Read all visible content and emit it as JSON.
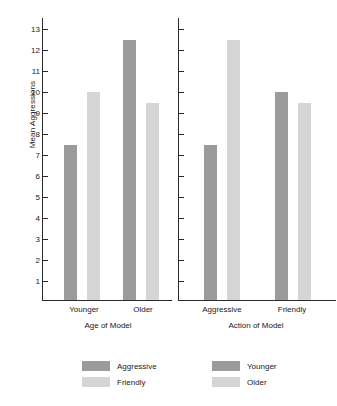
{
  "chart_data": {
    "type": "bar",
    "title": "",
    "ylabel": "Mean Aggressions",
    "ylim": [
      0,
      13.6
    ],
    "yticks": [
      1,
      2,
      3,
      4,
      5,
      6,
      7,
      8,
      9,
      10,
      11,
      12,
      13
    ],
    "grid": false,
    "legend_position": "bottom",
    "colors": {
      "dark": "#9b9b9b",
      "light": "#d5d5d5",
      "axis": "#2a2a2a",
      "text": "#1a1a1a",
      "background": "#ffffff"
    },
    "panels": [
      {
        "id": "age-of-model",
        "xlabel": "Age of Model",
        "categories": [
          "Younger",
          "Older"
        ],
        "series": [
          {
            "name": "Aggressive",
            "color": "#9b9b9b",
            "values": [
              7.5,
              12.5
            ]
          },
          {
            "name": "Friendly",
            "color": "#d5d5d5",
            "values": [
              10.0,
              9.5
            ]
          }
        ]
      },
      {
        "id": "action-of-model",
        "xlabel": "Action of Model",
        "categories": [
          "Aggressive",
          "Friendly"
        ],
        "series": [
          {
            "name": "Younger",
            "color": "#9b9b9b",
            "values": [
              7.5,
              10.0
            ]
          },
          {
            "name": "Older",
            "color": "#d5d5d5",
            "values": [
              12.5,
              9.5
            ]
          }
        ]
      }
    ]
  },
  "axis": {
    "ylabel": "Mean Aggressions",
    "tick_1": "1",
    "tick_2": "2",
    "tick_3": "3",
    "tick_4": "4",
    "tick_5": "5",
    "tick_6": "6",
    "tick_7": "7",
    "tick_8": "8",
    "tick_9": "9",
    "tick_10": "10",
    "tick_11": "11",
    "tick_12": "12",
    "tick_13": "13"
  },
  "panel_left": {
    "group_1": "Younger",
    "group_2": "Older",
    "axis_title": "Age of Model"
  },
  "panel_right": {
    "group_1": "Aggressive",
    "group_2": "Friendly",
    "axis_title": "Action of Model"
  },
  "legend_left": {
    "item_1": "Aggressive",
    "item_2": "Friendly"
  },
  "legend_right": {
    "item_1": "Younger",
    "item_2": "Older"
  }
}
